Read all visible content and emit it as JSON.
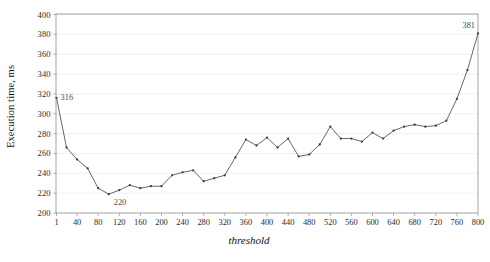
{
  "chart_data": {
    "type": "line",
    "title": "",
    "xlabel": "threshold",
    "ylabel": "Execution time, ms",
    "xlim": [
      1,
      800
    ],
    "ylim": [
      200,
      400
    ],
    "grid": true,
    "legend": null,
    "y_ticks": [
      200,
      220,
      240,
      260,
      280,
      300,
      320,
      340,
      360,
      380,
      400
    ],
    "x_ticks": [
      1,
      40,
      80,
      120,
      160,
      200,
      240,
      280,
      320,
      360,
      400,
      440,
      480,
      520,
      560,
      600,
      640,
      680,
      720,
      760,
      800
    ],
    "series": [
      {
        "name": "execution time",
        "marker": "dot",
        "color": "#4b4b4b",
        "x": [
          1,
          20,
          40,
          60,
          80,
          100,
          120,
          140,
          160,
          180,
          200,
          220,
          240,
          260,
          280,
          300,
          320,
          340,
          360,
          380,
          400,
          420,
          440,
          460,
          480,
          500,
          520,
          540,
          560,
          580,
          600,
          620,
          640,
          660,
          680,
          700,
          720,
          740,
          760,
          780,
          800
        ],
        "values": [
          316,
          266,
          254,
          245,
          225,
          219,
          223,
          228,
          225,
          227,
          227,
          238,
          241,
          243,
          232,
          235,
          238,
          256,
          274,
          268,
          276,
          266,
          275,
          257,
          259,
          269,
          287,
          275,
          275,
          272,
          281,
          275,
          283,
          287,
          289,
          287,
          288,
          293,
          315,
          344,
          381
        ]
      }
    ],
    "annotations": [
      {
        "label": "316",
        "x": 1,
        "y": 316,
        "position": "right"
      },
      {
        "label": "220",
        "x": 100,
        "y": 219,
        "position": "below-right"
      },
      {
        "label": "381",
        "x": 800,
        "y": 381,
        "position": "above-left"
      }
    ]
  },
  "axis": {
    "y_title": "Execution time, ms",
    "x_title": "threshold"
  }
}
